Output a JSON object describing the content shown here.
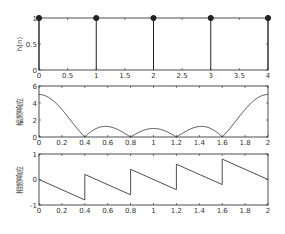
{
  "figure": {
    "background": "#ffffff",
    "line_color": "#222222"
  },
  "chart_data": [
    {
      "type": "stem",
      "title": "",
      "xlabel": "",
      "ylabel": "h(n)",
      "x": [
        0,
        1,
        2,
        3,
        4
      ],
      "values": [
        1,
        1,
        1,
        1,
        1
      ],
      "xlim": [
        0,
        4
      ],
      "ylim": [
        0,
        1
      ],
      "xticks": [
        "0",
        "0.5",
        "1",
        "1.5",
        "2",
        "2.5",
        "3",
        "3.5",
        "4"
      ],
      "xtick_values": [
        0,
        0.5,
        1,
        1.5,
        2,
        2.5,
        3,
        3.5,
        4
      ],
      "yticks": [
        "0",
        "0.5",
        "1"
      ],
      "ytick_values": [
        0,
        0.5,
        1
      ],
      "grid": false
    },
    {
      "type": "line",
      "title": "",
      "xlabel": "",
      "ylabel": "幅频响应",
      "description": "Magnitude |H(ω)| of 5-point moving average, x = ω/π",
      "x": [
        0,
        0.2,
        0.4,
        0.6,
        0.8,
        1.0,
        1.2,
        1.4,
        1.6,
        1.8,
        2.0
      ],
      "values": [
        5,
        3.24,
        0,
        1.24,
        0,
        1,
        0,
        1.24,
        0,
        3.24,
        5
      ],
      "xlim": [
        0,
        2
      ],
      "ylim": [
        0,
        6
      ],
      "xticks": [
        "0",
        "0.2",
        "0.4",
        "0.6",
        "0.8",
        "1",
        "1.2",
        "1.4",
        "1.6",
        "1.8",
        "2"
      ],
      "xtick_values": [
        0,
        0.2,
        0.4,
        0.6,
        0.8,
        1,
        1.2,
        1.4,
        1.6,
        1.8,
        2
      ],
      "yticks": [
        "0",
        "2",
        "4",
        "6"
      ],
      "ytick_values": [
        0,
        2,
        4,
        6
      ],
      "grid": false
    },
    {
      "type": "line",
      "title": "",
      "xlabel": "",
      "ylabel": "相频响应",
      "description": "Phase/π, sawtooth with +1 jumps at 0.4, 0.8, 1.2, 1.6",
      "x": [
        0,
        0.4,
        0.4,
        0.8,
        0.8,
        1.2,
        1.2,
        1.6,
        1.6,
        2.0
      ],
      "values": [
        0,
        -0.8,
        0.2,
        -0.6,
        0.4,
        -0.4,
        0.6,
        -0.2,
        0.8,
        0
      ],
      "xlim": [
        0,
        2
      ],
      "ylim": [
        -1,
        1
      ],
      "xticks": [
        "0",
        "0.2",
        "0.4",
        "0.6",
        "0.8",
        "1",
        "1.2",
        "1.4",
        "1.6",
        "1.8",
        "2"
      ],
      "xtick_values": [
        0,
        0.2,
        0.4,
        0.6,
        0.8,
        1,
        1.2,
        1.4,
        1.6,
        1.8,
        2
      ],
      "yticks": [
        "-1",
        "0",
        "1"
      ],
      "ytick_values": [
        -1,
        0,
        1
      ],
      "grid": false
    }
  ],
  "axes_layout": [
    {
      "left": 39,
      "top": 18,
      "right": 268,
      "bottom": 70
    },
    {
      "left": 39,
      "top": 86,
      "right": 268,
      "bottom": 137
    },
    {
      "left": 39,
      "top": 154,
      "right": 268,
      "bottom": 205
    }
  ]
}
